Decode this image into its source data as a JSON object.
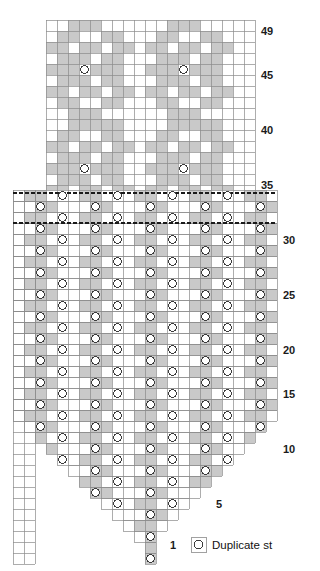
{
  "chart_data": {
    "type": "heatmap",
    "title": "",
    "xlabel": "",
    "ylabel": "",
    "grid": true,
    "cell_size": 11,
    "colors": {
      "shaded_cell": "#c9c9c9",
      "empty_cell": "#ffffff",
      "grid_line": "#8a8a8a",
      "grid_line_minor": "#b6b6b6",
      "symbol_stroke": "#3d3d3d",
      "symbol_fill": "#ffffff",
      "repeat_line": "#1a1a1a",
      "label_text": "#1b1b1b"
    },
    "upper_chart": {
      "name": "upper-motif-chart",
      "origin_x": 46,
      "origin_y": 20,
      "columns": 19,
      "rows": 16,
      "first_row_number": 34,
      "last_row_number": 49,
      "row_labels": [
        {
          "row": 49,
          "y": 31
        },
        {
          "row": 45,
          "y": 75
        },
        {
          "row": 40,
          "y": 130
        },
        {
          "row": 35,
          "y": 185
        }
      ],
      "shaded_cells_by_row": {
        "49": [
          2,
          3,
          4,
          11,
          12,
          13
        ],
        "48": [
          1,
          2,
          5,
          6,
          10,
          11,
          14,
          15
        ],
        "47": [
          0,
          1,
          3,
          4,
          6,
          7,
          9,
          10,
          12,
          13,
          15,
          16
        ],
        "46": [
          1,
          2,
          3,
          5,
          6,
          10,
          11,
          12,
          14,
          15
        ],
        "45": [
          0,
          1,
          2,
          4,
          5,
          6,
          9,
          10,
          11,
          13,
          14,
          15
        ],
        "44": [
          1,
          2,
          3,
          5,
          6,
          10,
          11,
          12,
          14,
          15
        ],
        "43": [
          0,
          1,
          3,
          4,
          6,
          7,
          9,
          10,
          12,
          13,
          15,
          16
        ],
        "42": [
          1,
          2,
          5,
          6,
          10,
          11,
          14,
          15
        ],
        "41": [
          2,
          3,
          4,
          11,
          12,
          13
        ],
        "40": [
          2,
          3,
          4,
          5,
          6,
          11,
          12,
          13,
          14,
          15
        ],
        "39": [
          1,
          2,
          5,
          6,
          10,
          11,
          14,
          15
        ],
        "38": [
          0,
          1,
          3,
          4,
          6,
          7,
          9,
          10,
          12,
          13,
          15,
          16
        ],
        "37": [
          1,
          2,
          3,
          5,
          6,
          10,
          11,
          12,
          14,
          15
        ],
        "36": [
          0,
          1,
          2,
          4,
          5,
          6,
          9,
          10,
          11,
          13,
          14,
          15
        ],
        "35": [
          1,
          2,
          3,
          5,
          6,
          10,
          11,
          12,
          14,
          15
        ],
        "34": [
          0,
          1,
          3,
          4,
          6,
          7,
          9,
          10,
          12,
          13,
          15,
          16
        ]
      },
      "duplicate_stitches": [
        {
          "row": 45,
          "col": 3
        },
        {
          "row": 45,
          "col": 12
        },
        {
          "row": 36,
          "col": 3
        },
        {
          "row": 36,
          "col": 12
        }
      ]
    },
    "lower_chart": {
      "name": "lower-body-chart",
      "origin_x": 13,
      "origin_y": 190,
      "columns": 24,
      "rows": 34,
      "first_row_number": 1,
      "last_row_number": 34,
      "row_labels": [
        {
          "row": 30,
          "y": 240
        },
        {
          "row": 25,
          "y": 295
        },
        {
          "row": 20,
          "y": 350
        },
        {
          "row": 15,
          "y": 394
        },
        {
          "row": 10,
          "y": 449
        },
        {
          "row": 5,
          "y": 504
        },
        {
          "row": 1,
          "y": 548
        }
      ],
      "repeat_lines_y": [
        193,
        223
      ],
      "repeat_line_style": "dashed",
      "pattern_note": "5-stitch repeat of vertical shaded columns with alternating duplicate stitch placement",
      "duplicate_stitch_columns_odd": [
        2,
        7,
        12,
        17,
        22
      ],
      "duplicate_stitch_columns_even": [
        4,
        9,
        14,
        19
      ],
      "shaded_column_groups": [
        [
          1,
          2,
          3
        ],
        [
          6,
          7,
          8
        ],
        [
          11,
          12,
          13
        ],
        [
          16,
          17,
          18
        ],
        [
          21,
          22,
          23
        ]
      ],
      "decrease_shape": "V-shaped point, one stitch decreased each side every row below row 14",
      "left_selvedge_columns": 2
    },
    "legend": {
      "symbol": "circle",
      "label": "Duplicate st"
    },
    "edge_label_1": "1"
  }
}
